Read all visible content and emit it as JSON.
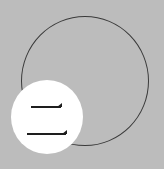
{
  "glyph": {
    "character": "二",
    "meaning": "two"
  },
  "colors": {
    "background": "#bcbcbc",
    "outline": "#3a3a3a",
    "badge": "#ffffff",
    "glyph": "#1e1e1e"
  }
}
